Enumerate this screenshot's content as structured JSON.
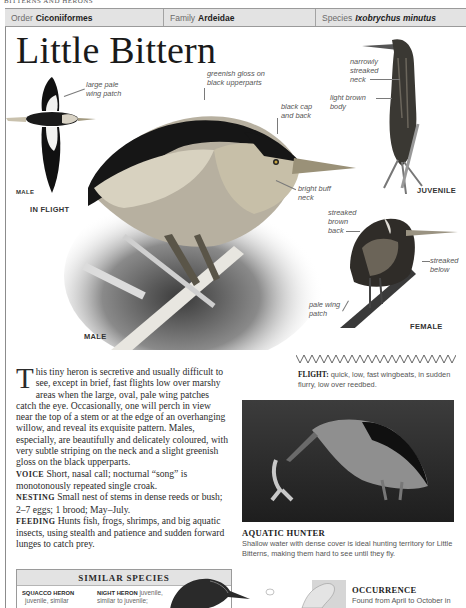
{
  "running_head": "BITTERNS AND HERONS",
  "taxonomy": {
    "order_label": "Order",
    "order_value": "Ciconiiformes",
    "family_label": "Family",
    "family_value": "Ardeidae",
    "species_label": "Species",
    "species_value": "Ixobrychus minutus"
  },
  "title": "Little Bittern",
  "illustrations": {
    "in_flight": {
      "caption": "IN FLIGHT",
      "sex_label": "MALE",
      "annotations": [
        "large pale wing patch"
      ]
    },
    "male": {
      "caption": "MALE",
      "annotations": [
        "greenish gloss on black upperparts",
        "black cap and back",
        "bright buff neck"
      ]
    },
    "juvenile": {
      "caption": "JUVENILE",
      "annotations": [
        "narrowly streaked neck",
        "light brown body"
      ]
    },
    "female": {
      "caption": "FEMALE",
      "annotations": [
        "streaked brown back",
        "streaked below",
        "pale wing patch"
      ]
    }
  },
  "labels": {
    "wing_patch_1": "large pale",
    "wing_patch_2": "wing patch",
    "gloss_1": "greenish gloss on",
    "gloss_2": "black upperparts",
    "cap_1": "black cap",
    "cap_2": "and back",
    "buff_1": "bright buff",
    "buff_2": "neck",
    "narrow_1": "narrowly",
    "narrow_2": "streaked",
    "narrow_3": "neck",
    "light_1": "light brown",
    "light_2": "body",
    "sback_1": "streaked",
    "sback_2": "brown",
    "sback_3": "back",
    "sbelow_1": "streaked",
    "sbelow_2": "below",
    "pale_1": "pale wing",
    "pale_2": "patch"
  },
  "description": {
    "dropcap": "T",
    "intro": "his tiny heron is secretive and usually difficult to see, except in brief, fast flights low over marshy areas when the large, oval, pale wing patches catch the eye. Occasionally, one will perch in view near the top of a stem or at the edge of an overhanging willow, and reveal its exquisite pattern. Males, especially, are beautifully and delicately coloured, with very subtle striping on the neck and a slight greenish gloss on the black upperparts.",
    "facts": [
      {
        "key": "VOICE",
        "text": "Short, nasal call; nocturnal “song” is monotonously repeated single croak."
      },
      {
        "key": "NESTING",
        "text": "Small nest of stems in dense reeds or bush; 2–7 eggs; 1 brood; May–July."
      },
      {
        "key": "FEEDING",
        "text": "Hunts fish, frogs, shrimps, and big aquatic insects, using stealth and patience and sudden forward lunges to catch prey."
      }
    ]
  },
  "flight": {
    "label": "FLIGHT:",
    "text": "quick, low, fast wingbeats, in sudden flurry, low over reedbed."
  },
  "photo": {
    "title": "AQUATIC HUNTER",
    "caption": "Shallow water with dense cover is ideal hunting territory for Little Bitterns, making them hard to see until they fly."
  },
  "similar_species": {
    "heading": "SIMILAR SPECIES",
    "items": [
      {
        "name": "SQUACCO HERON",
        "text_1": "juvenile, similar"
      },
      {
        "name": "NIGHT HERON",
        "text_1": "juvenile,",
        "text_2": "similar to juvenile;"
      }
    ]
  },
  "occurrence": {
    "title": "OCCURRENCE",
    "text": "Found from April to October in"
  }
}
